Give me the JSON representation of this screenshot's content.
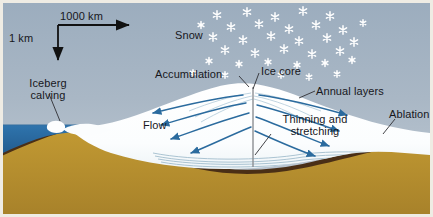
{
  "figure": {
    "scale": {
      "horizontal_label": "1000 km",
      "vertical_label": "1 km"
    },
    "labels": {
      "snow": "Snow",
      "accumulation": "Accumulation",
      "ice_core": "Ice core",
      "annual_layers": "Annual layers",
      "ablation": "Ablation",
      "flow": "Flow",
      "thinning_and_stretching": "Thinning and stretching",
      "iceberg_calving": "Iceberg calving"
    },
    "colors": {
      "sky": "#a7b5c3",
      "sky_top": "#9fb0c0",
      "ice": "#fdfdfd",
      "ocean": "#2c6ca6",
      "bedrock": "#b9912f",
      "bedrock_line": "#4a2f16",
      "arrow": "#2b6b9e",
      "layer_line": "#9fb9c9",
      "text": "#17171c",
      "frame": "#efece4"
    },
    "counts": {
      "snowflakes": 34,
      "flow_arrows": 8
    }
  }
}
